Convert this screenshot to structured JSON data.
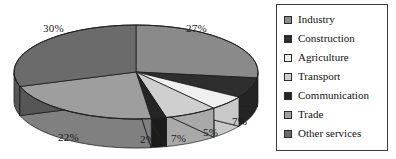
{
  "chart_data": {
    "type": "pie",
    "title": "",
    "subtitle": "",
    "xlabel": "",
    "ylabel": "",
    "grid": false,
    "three_d": true,
    "units": "percent",
    "legend_position": "right",
    "categories": [
      "Industry",
      "Construction",
      "Agriculture",
      "Transport",
      "Communication",
      "Trade",
      "Other services"
    ],
    "values": [
      27,
      7,
      5,
      7,
      2,
      22,
      30
    ],
    "labels": [
      "27%",
      "7%",
      "5%",
      "7%",
      "2%",
      "22%",
      "30%"
    ],
    "colors": [
      "#8a8a8a",
      "#2e2e2e",
      "#f0f0f0",
      "#cfcfcf",
      "#252525",
      "#9e9e9e",
      "#6b6b6b"
    ],
    "total": 100,
    "slices": [
      {
        "name": "Industry",
        "value": 27,
        "label": "27%",
        "color": "#8a8a8a",
        "side_color": "#6f6f6f"
      },
      {
        "name": "Construction",
        "value": 7,
        "label": "7%",
        "color": "#2e2e2e",
        "side_color": "#242424"
      },
      {
        "name": "Agriculture",
        "value": 5,
        "label": "5%",
        "color": "#f0f0f0",
        "side_color": "#c8c8c8"
      },
      {
        "name": "Transport",
        "value": 7,
        "label": "7%",
        "color": "#cfcfcf",
        "side_color": "#a9a9a9"
      },
      {
        "name": "Communication",
        "value": 2,
        "label": "2%",
        "color": "#252525",
        "side_color": "#1c1c1c"
      },
      {
        "name": "Trade",
        "value": 22,
        "label": "22%",
        "color": "#9e9e9e",
        "side_color": "#808080"
      },
      {
        "name": "Other services",
        "value": 30,
        "label": "30%",
        "color": "#6b6b6b",
        "side_color": "#565656"
      }
    ]
  },
  "labels": {
    "industry_pct": "27%",
    "construction_pct": "7%",
    "agriculture_pct": "5%",
    "transport_pct": "7%",
    "communication_pct": "2%",
    "trade_pct": "22%",
    "other_services_pct": "30%"
  },
  "legend": {
    "items": [
      {
        "label": "Industry",
        "color": "#8a8a8a"
      },
      {
        "label": "Construction",
        "color": "#2e2e2e"
      },
      {
        "label": "Agriculture",
        "color": "#f0f0f0"
      },
      {
        "label": "Transport",
        "color": "#cfcfcf"
      },
      {
        "label": "Communication",
        "color": "#252525"
      },
      {
        "label": "Trade",
        "color": "#9e9e9e"
      },
      {
        "label": "Other services",
        "color": "#6b6b6b"
      }
    ]
  },
  "style": {
    "background": "#ffffff",
    "legend_border": "#3b3b3b",
    "outline": "#1f1f1f",
    "text": "#121212"
  }
}
